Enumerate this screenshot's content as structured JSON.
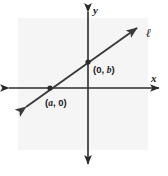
{
  "figure": {
    "type": "coordinate-plane-line-graph",
    "width": 168,
    "height": 176,
    "background_color": "#ffffff",
    "plot_panel_color": "#f5f5f5",
    "ink_color": "#2b2b2b"
  },
  "axes": {
    "origin": {
      "x": 88,
      "y": 88
    },
    "x_axis": {
      "label": "x",
      "label_pos": {
        "x": 152,
        "y": 80
      },
      "start": {
        "x": 5,
        "y": 88
      },
      "end": {
        "x": 163,
        "y": 88
      },
      "arrows": "both"
    },
    "y_axis": {
      "label": "y",
      "label_pos": {
        "x": 93,
        "y": 12
      },
      "start": {
        "x": 88,
        "y": 8
      },
      "end": {
        "x": 88,
        "y": 168
      },
      "arrows": "both"
    }
  },
  "line": {
    "label": "ℓ",
    "label_pos": {
      "x": 146,
      "y": 36
    },
    "arrow_start": {
      "x": 22,
      "y": 110
    },
    "arrow_end": {
      "x": 141,
      "y": 25
    },
    "arrows": "both",
    "color": "#3a3a3a"
  },
  "points": [
    {
      "name": "y-intercept",
      "label_prefix": "(0, ",
      "label_var": "b",
      "label_suffix": ")",
      "label_full": "(0, b)",
      "cx": 88,
      "cy": 62,
      "label_x": 93,
      "label_y": 72
    },
    {
      "name": "x-intercept",
      "label_prefix": "(",
      "label_var": "a",
      "label_suffix": ", 0)",
      "label_full": "(a, 0)",
      "cx": 50,
      "cy": 88,
      "label_x": 46,
      "label_y": 105
    }
  ],
  "panel": {
    "x": 18,
    "y": 18,
    "width": 130,
    "height": 132
  }
}
